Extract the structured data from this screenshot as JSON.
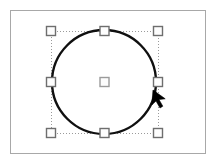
{
  "app": {
    "title": "Shape Selection Canvas",
    "width": 220,
    "height": 166,
    "background_color": "#ffffff"
  },
  "canvas": {
    "name": "drawing-canvas",
    "frame": {
      "x": 10,
      "y": 10,
      "width": 196,
      "height": 144,
      "border_color": "#a8a8a8",
      "border_width": 1,
      "fill_color": "#ffffff"
    }
  },
  "shape": {
    "type": "circle",
    "label": "Circle",
    "center_x": 104,
    "center_y": 82,
    "radius": 52,
    "stroke_color": "#101010",
    "stroke_width": 2.4,
    "fill": "none"
  },
  "selection": {
    "label": "Selection bounding box",
    "bbox": {
      "x": 51,
      "y": 31,
      "width": 107,
      "height": 102
    },
    "outline_color": "#9a9a9a",
    "outline_style": "dotted",
    "outline_width": 1,
    "handle": {
      "size": 9,
      "fill_color": "#fdfdfd",
      "border_color": "#6e6e6e",
      "border_width": 1.4
    },
    "handles": [
      {
        "name": "handle-top-left",
        "position": "top-left",
        "x": 51,
        "y": 31,
        "cursor": "nwse-resize"
      },
      {
        "name": "handle-top-center",
        "position": "top-center",
        "x": 104.5,
        "y": 31,
        "cursor": "ns-resize"
      },
      {
        "name": "handle-top-right",
        "position": "top-right",
        "x": 158,
        "y": 31,
        "cursor": "nesw-resize"
      },
      {
        "name": "handle-middle-left",
        "position": "middle-left",
        "x": 51,
        "y": 82,
        "cursor": "ew-resize"
      },
      {
        "name": "handle-center",
        "position": "center",
        "x": 104.5,
        "y": 82,
        "cursor": "move"
      },
      {
        "name": "handle-middle-right",
        "position": "middle-right",
        "x": 158,
        "y": 82,
        "cursor": "ew-resize"
      },
      {
        "name": "handle-bottom-left",
        "position": "bottom-left",
        "x": 51,
        "y": 133,
        "cursor": "nwse-resize"
      },
      {
        "name": "handle-bottom-center",
        "position": "bottom-center",
        "x": 104.5,
        "y": 133,
        "cursor": "ns-resize"
      },
      {
        "name": "handle-bottom-right",
        "position": "bottom-right",
        "x": 158,
        "y": 133,
        "cursor": "nesw-resize"
      }
    ]
  },
  "cursor": {
    "name": "mouse-pointer",
    "label": "Arrow pointer",
    "tip_x": 153,
    "tip_y": 90,
    "color": "#000000",
    "direction": "up-left"
  }
}
